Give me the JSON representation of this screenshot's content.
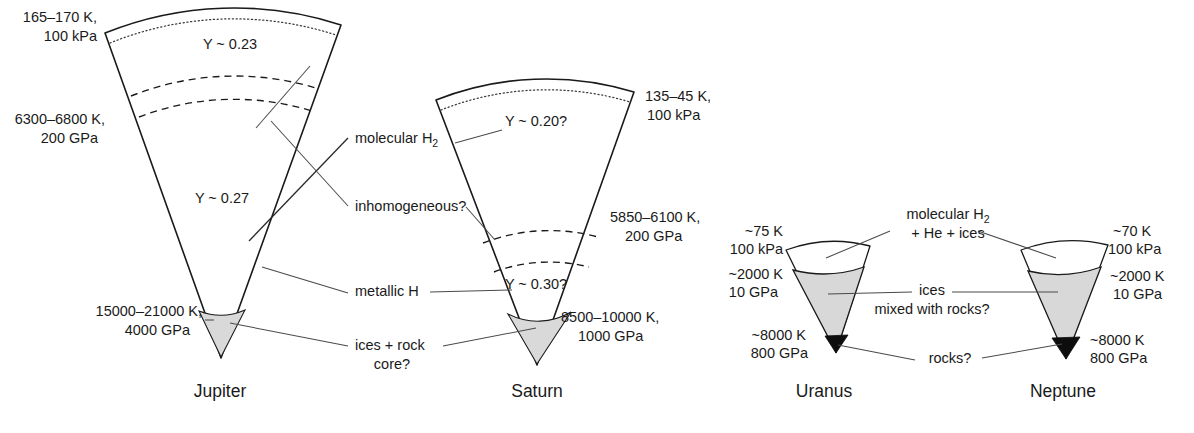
{
  "figure": {
    "type": "diagram"
  },
  "planets": [
    {
      "key": "jupiter",
      "name": "Jupiter",
      "name_x": 220,
      "name_y": 397,
      "layers": [
        {
          "key": "outer",
          "label": "Y ~ 0.23",
          "x": 230,
          "y": 49
        },
        {
          "key": "inner",
          "label": "Y ~ 0.27",
          "x": 222,
          "y": 203
        }
      ],
      "conditions": [
        {
          "key": "surface",
          "line1": "165–170 K,",
          "line2": "100 kPa",
          "x": 97,
          "y1": 22,
          "y2": 41,
          "anchor": "end"
        },
        {
          "key": "middle",
          "line1": "6300–6800 K,",
          "line2": "200 GPa",
          "x": 105,
          "y1": 124,
          "y2": 143,
          "anchor": "end"
        },
        {
          "key": "core",
          "line1": "15000–21000 K,",
          "line2": "4000 GPa",
          "x": 202,
          "y1": 316,
          "y2": 335,
          "anchor": "end"
        }
      ]
    },
    {
      "key": "saturn",
      "name": "Saturn",
      "name_x": 537,
      "name_y": 397,
      "layers": [
        {
          "key": "outer",
          "label": "Y ~ 0.20?",
          "x": 536,
          "y": 126
        },
        {
          "key": "inner",
          "label": "Y ~ 0.30?",
          "x": 536,
          "y": 289
        }
      ],
      "conditions": [
        {
          "key": "surface",
          "line1": "135–45 K,",
          "line2": "100 kPa",
          "x": 645,
          "y1": 101,
          "y2": 120,
          "anchor": "start"
        },
        {
          "key": "middle",
          "line1": "5850–6100 K,",
          "line2": "200 GPa",
          "x": 610,
          "y1": 222,
          "y2": 241,
          "anchor": "start"
        },
        {
          "key": "core",
          "line1": "8500–10000 K,",
          "line2": "1000 GPa",
          "x": 561,
          "y1": 322,
          "y2": 341,
          "anchor": "start"
        }
      ]
    },
    {
      "key": "uranus",
      "name": "Uranus",
      "name_x": 824,
      "name_y": 397,
      "layers": [],
      "conditions": [
        {
          "key": "surface",
          "line1": "~75 K",
          "line2": "100 kPa",
          "x": 783,
          "y1": 236,
          "y2": 254,
          "anchor": "end"
        },
        {
          "key": "ice",
          "line1": "~2000 K",
          "line2": "10 GPa",
          "x": 783,
          "y1": 279,
          "y2": 297,
          "anchor": "end"
        },
        {
          "key": "core",
          "line1": "~8000 K",
          "line2": "800 GPa",
          "x": 806,
          "y1": 340,
          "y2": 358,
          "anchor": "end"
        }
      ]
    },
    {
      "key": "neptune",
      "name": "Neptune",
      "name_x": 1063,
      "name_y": 397,
      "layers": [],
      "conditions": [
        {
          "key": "surface",
          "line1": "~70 K",
          "line2": "100 kPa",
          "x": 1113,
          "y1": 236,
          "y2": 254,
          "anchor": "start"
        },
        {
          "key": "ice",
          "line1": "~2000 K",
          "line2": "10 GPa",
          "x": 1110,
          "y1": 281,
          "y2": 299,
          "anchor": "start"
        },
        {
          "key": "core",
          "line1": "~8000 K",
          "line2": "800 GPa",
          "x": 1090,
          "y1": 345,
          "y2": 363,
          "anchor": "start"
        }
      ]
    }
  ],
  "callouts": [
    {
      "key": "molecular-h2",
      "text": "molecular H",
      "sub": "2",
      "x": 355,
      "y": 143,
      "anchor": "start",
      "has_sub": true
    },
    {
      "key": "inhomogeneous",
      "text": "inhomogeneous?",
      "x": 355,
      "y": 211,
      "anchor": "start",
      "has_sub": false
    },
    {
      "key": "metallic-h",
      "text": "metallic H",
      "x": 355,
      "y": 296,
      "anchor": "start",
      "has_sub": false
    },
    {
      "key": "ices-rock-core-l1",
      "text": "ices + rock",
      "x": 355,
      "y": 350,
      "anchor": "start",
      "has_sub": false
    },
    {
      "key": "ices-rock-core-l2",
      "text": "core?",
      "x": 380,
      "y": 369,
      "anchor": "start",
      "has_sub": false
    },
    {
      "key": "molecular-h2-ice-l1",
      "text": "molecular H",
      "sub": "2",
      "x": 895,
      "y": 219,
      "anchor": "start",
      "has_sub": true
    },
    {
      "key": "molecular-h2-ice-l2",
      "text": "+ He + ices",
      "x": 904,
      "y": 238,
      "anchor": "start",
      "has_sub": false
    },
    {
      "key": "ices-mixed-l1",
      "text": "ices",
      "x": 932,
      "y": 295,
      "anchor": "middle",
      "has_sub": false
    },
    {
      "key": "ices-mixed-l2",
      "text": "mixed with rocks?",
      "x": 932,
      "y": 314,
      "anchor": "middle",
      "has_sub": false
    },
    {
      "key": "rocks",
      "text": "rocks?",
      "x": 952,
      "y": 363,
      "anchor": "middle",
      "has_sub": false
    }
  ],
  "colors": {
    "stroke": "#1a1a1a",
    "core_fill": "#d9d9d9",
    "ice_fill": "#d8d8d8",
    "rock_fill": "#0d0d0d",
    "background": "#ffffff",
    "leader": "#4a4a4a"
  }
}
